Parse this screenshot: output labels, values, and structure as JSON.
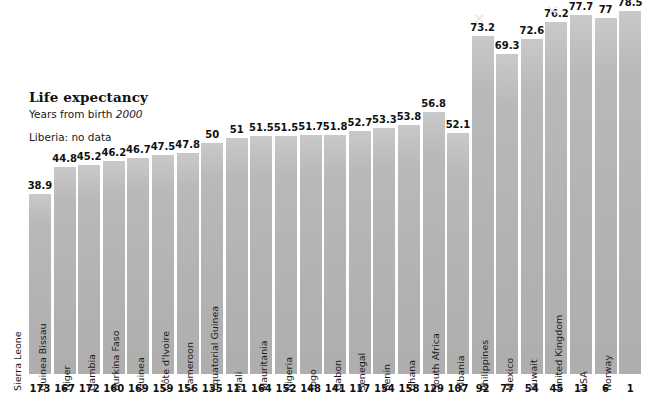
{
  "header": {
    "title": "Life expectancy",
    "subtitle_prefix": "Years from birth ",
    "subtitle_year": "2000",
    "note": "Liberia: no data"
  },
  "chart_data": {
    "type": "bar",
    "title": "Life expectancy",
    "subtitle": "Years from birth 2000",
    "annotation": "Liberia: no data",
    "xlabel": "",
    "ylabel": "Years from birth",
    "ylim": [
      0,
      78.5
    ],
    "grid": false,
    "legend": false,
    "bar_color": "#b6b6b6",
    "background_color": "#ffffff",
    "text_color": "#111111",
    "value_label_format": "one-decimal (trailing .0 omitted)",
    "rank_axis_label": "world rank",
    "groups": [
      {
        "name": "lowest-life-expectancy-countries",
        "categories": [
          "Sierra Leone",
          "Guinea Bissau",
          "Niger",
          "Gambia",
          "Burkina Faso",
          "Guinea",
          "Côte d'Ivoire",
          "Cameroon",
          "Equatorial Guinea",
          "Mali",
          "Mauritania",
          "Nigeria",
          "Togo",
          "Gabon",
          "Senegal",
          "Benin",
          "Ghana"
        ],
        "values": [
          38.9,
          44.8,
          45.2,
          46.2,
          46.7,
          47.5,
          47.8,
          50,
          51,
          51.5,
          51.5,
          51.7,
          51.8,
          52.7,
          53.3,
          53.8,
          56.8
        ],
        "value_labels": [
          "38.9",
          "44.8",
          "45.2",
          "46.2",
          "46.7",
          "47.5",
          "47.8",
          "50",
          "51",
          "51.5",
          "51.5",
          "51.7",
          "51.8",
          "52.7",
          "53.3",
          "53.8",
          "56.8"
        ],
        "ranks": [
          "173",
          "167",
          "172",
          "160",
          "169",
          "159",
          "156",
          "135",
          "111",
          "164",
          "152",
          "148",
          "141",
          "117",
          "154",
          "158",
          "129"
        ]
      },
      {
        "name": "comparison-countries",
        "categories": [
          "South Africa",
          "Albania",
          "Philippines",
          "Mexico",
          "Kuwait",
          "United Kingdom",
          "USA",
          "Norway"
        ],
        "values": [
          52.1,
          73.2,
          69.3,
          72.6,
          76.2,
          77.7,
          77,
          78.5
        ],
        "value_labels": [
          "52.1",
          "73.2",
          "69.3",
          "72.6",
          "76.2",
          "77.7",
          "77",
          "78.5"
        ],
        "ranks": [
          "107",
          "92",
          "77",
          "54",
          "45",
          "13",
          "6",
          "1"
        ]
      }
    ]
  },
  "marks": {
    "crop_mark_glyph": "✕"
  }
}
